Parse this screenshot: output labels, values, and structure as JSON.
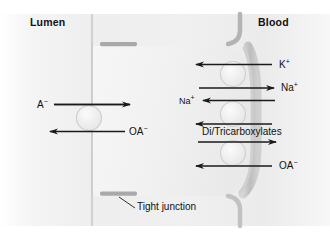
{
  "diagram": {
    "compartments": [
      {
        "id": "lumen",
        "label": "Lumen",
        "side": "left"
      },
      {
        "id": "blood",
        "label": "Blood",
        "side": "right"
      }
    ],
    "annotations": [
      {
        "id": "tight-junction",
        "label": "Tight junction"
      }
    ],
    "apical_transport": [
      {
        "id": "a-minus-in",
        "label": "A",
        "charge": "−",
        "direction": "right",
        "membrane": "apical"
      },
      {
        "id": "oa-minus-out",
        "label": "OA",
        "charge": "−",
        "direction": "left",
        "membrane": "apical"
      }
    ],
    "basolateral_transport": [
      {
        "id": "k-in",
        "label": "K",
        "charge": "+",
        "direction": "left",
        "membrane": "basolateral"
      },
      {
        "id": "na-out",
        "label": "Na",
        "charge": "+",
        "direction": "right",
        "membrane": "basolateral"
      },
      {
        "id": "na-in",
        "label": "Na",
        "charge": "+",
        "direction": "left",
        "membrane": "basolateral"
      },
      {
        "id": "dicarb-in",
        "label": "Di/Tricarboxylates",
        "charge": "",
        "direction": "left",
        "membrane": "basolateral"
      },
      {
        "id": "dicarb-out",
        "label": "Di/Tricarboxylates",
        "charge": "",
        "direction": "right",
        "membrane": "basolateral"
      },
      {
        "id": "oa-in",
        "label": "OA",
        "charge": "−",
        "direction": "left",
        "membrane": "basolateral"
      }
    ],
    "transporters": [
      {
        "id": "apical-exchanger",
        "membrane": "apical"
      },
      {
        "id": "basolateral-pump",
        "membrane": "basolateral"
      },
      {
        "id": "basolateral-cotransporter",
        "membrane": "basolateral"
      },
      {
        "id": "basolateral-oa-exchanger",
        "membrane": "basolateral"
      }
    ],
    "colors": {
      "background": "#ffffff",
      "cell_fill": "#f2f2f2",
      "membrane_line": "#c9c9c9",
      "basolateral_band": "#bfbfbf",
      "tight_junction": "#a8a8a8",
      "arrow": "#1a1a1a",
      "text": "#111111"
    }
  }
}
